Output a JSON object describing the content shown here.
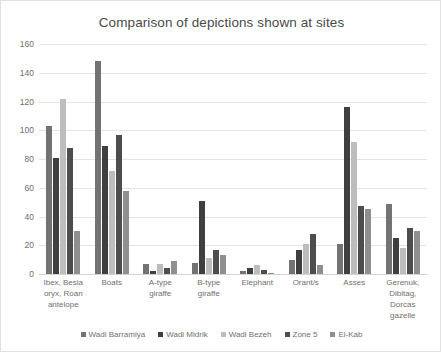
{
  "chart_data": {
    "type": "bar",
    "title": "Comparison of depictions shown at sites",
    "xlabel": "",
    "ylabel": "",
    "ylim": [
      0,
      160
    ],
    "yticks": [
      0,
      20,
      40,
      60,
      80,
      100,
      120,
      140,
      160
    ],
    "grid": true,
    "legend_position": "bottom",
    "categories": [
      "Ibex, Besia oryx, Roan antelope",
      "Boats",
      "A-type giraffe",
      "B-type giraffe",
      "Elephant",
      "Orant/s",
      "Asses",
      "Gerenuk, Dibitag, Dorcas gazelle"
    ],
    "series": [
      {
        "name": "Wadi Barramiya",
        "color": "#737373",
        "values": [
          103,
          148,
          7,
          8,
          2,
          10,
          21,
          49
        ]
      },
      {
        "name": "Wadi Midrik",
        "color": "#3f3f3f",
        "values": [
          81,
          89,
          2,
          51,
          4,
          17,
          116,
          25
        ]
      },
      {
        "name": "Wadi Bezeh",
        "color": "#bdbdbd",
        "values": [
          122,
          72,
          7,
          11,
          6,
          21,
          92,
          18
        ]
      },
      {
        "name": "Zone 5",
        "color": "#4d4d4d",
        "values": [
          88,
          97,
          4,
          17,
          3,
          28,
          47,
          32
        ]
      },
      {
        "name": "El-Kab",
        "color": "#8f8f8f",
        "values": [
          30,
          58,
          9,
          13,
          1,
          6,
          45,
          30
        ]
      }
    ]
  }
}
